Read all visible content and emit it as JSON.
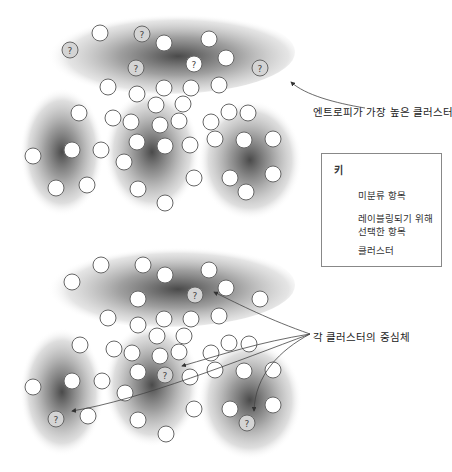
{
  "annotations": {
    "highest_entropy": "엔트로피가 가장 높은 클러스터",
    "centroids": "각 클러스터의 중심체"
  },
  "legend": {
    "title": "키",
    "items": [
      {
        "icon": "unlabeled-circle",
        "label": "미분류 항목"
      },
      {
        "icon": "question-circle",
        "label_line1": "레이블링되기 위해",
        "label_line2": "선택한 항목"
      },
      {
        "icon": "cluster-blob",
        "label": "클러스터"
      }
    ]
  },
  "question_mark": "?",
  "colors": {
    "cluster_dark": "#555555",
    "circle_fill": "#ffffff",
    "circle_stroke": "#666666",
    "selected_fill": "#d4d4d4"
  },
  "diagrams": [
    {
      "name": "entropy-sampling",
      "clusters": [
        {
          "cx": 165,
          "cy": 52,
          "rx": 130,
          "ry": 42,
          "type": "top"
        },
        {
          "cx": 62,
          "cy": 152,
          "rx": 42,
          "ry": 64
        },
        {
          "cx": 152,
          "cy": 152,
          "rx": 48,
          "ry": 62
        },
        {
          "cx": 250,
          "cy": 160,
          "rx": 52,
          "ry": 60
        }
      ],
      "items": [
        {
          "x": 100,
          "y": 33
        },
        {
          "x": 70,
          "y": 50,
          "q": true
        },
        {
          "x": 142,
          "y": 34,
          "q": true
        },
        {
          "x": 164,
          "y": 43
        },
        {
          "x": 209,
          "y": 39
        },
        {
          "x": 226,
          "y": 58
        },
        {
          "x": 136,
          "y": 68,
          "q": true
        },
        {
          "x": 194,
          "y": 64,
          "q": true,
          "white": true
        },
        {
          "x": 260,
          "y": 68,
          "q": true
        },
        {
          "x": 108,
          "y": 87
        },
        {
          "x": 137,
          "y": 94
        },
        {
          "x": 164,
          "y": 88
        },
        {
          "x": 191,
          "y": 88
        },
        {
          "x": 219,
          "y": 85
        },
        {
          "x": 156,
          "y": 105
        },
        {
          "x": 183,
          "y": 104
        },
        {
          "x": 113,
          "y": 118
        },
        {
          "x": 131,
          "y": 122
        },
        {
          "x": 160,
          "y": 125
        },
        {
          "x": 179,
          "y": 121
        },
        {
          "x": 211,
          "y": 122
        },
        {
          "x": 229,
          "y": 112
        },
        {
          "x": 248,
          "y": 113
        },
        {
          "x": 79,
          "y": 113
        },
        {
          "x": 72,
          "y": 150
        },
        {
          "x": 33,
          "y": 156
        },
        {
          "x": 101,
          "y": 150
        },
        {
          "x": 56,
          "y": 188
        },
        {
          "x": 87,
          "y": 185
        },
        {
          "x": 137,
          "y": 142
        },
        {
          "x": 165,
          "y": 146
        },
        {
          "x": 190,
          "y": 145
        },
        {
          "x": 124,
          "y": 162
        },
        {
          "x": 138,
          "y": 189
        },
        {
          "x": 194,
          "y": 178
        },
        {
          "x": 165,
          "y": 203
        },
        {
          "x": 215,
          "y": 139
        },
        {
          "x": 244,
          "y": 140
        },
        {
          "x": 273,
          "y": 139
        },
        {
          "x": 230,
          "y": 178
        },
        {
          "x": 246,
          "y": 192
        },
        {
          "x": 273,
          "y": 174
        }
      ]
    },
    {
      "name": "centroid-sampling",
      "clusters": [
        {
          "cx": 165,
          "cy": 285,
          "rx": 130,
          "ry": 42,
          "type": "top"
        },
        {
          "cx": 62,
          "cy": 392,
          "rx": 42,
          "ry": 64
        },
        {
          "cx": 152,
          "cy": 385,
          "rx": 48,
          "ry": 62
        },
        {
          "cx": 250,
          "cy": 400,
          "rx": 52,
          "ry": 60
        }
      ],
      "items": [
        {
          "x": 72,
          "y": 282
        },
        {
          "x": 101,
          "y": 265
        },
        {
          "x": 143,
          "y": 265
        },
        {
          "x": 165,
          "y": 275
        },
        {
          "x": 209,
          "y": 270
        },
        {
          "x": 226,
          "y": 288
        },
        {
          "x": 138,
          "y": 299
        },
        {
          "x": 195,
          "y": 295,
          "q": true
        },
        {
          "x": 260,
          "y": 299
        },
        {
          "x": 108,
          "y": 318
        },
        {
          "x": 138,
          "y": 325
        },
        {
          "x": 164,
          "y": 319
        },
        {
          "x": 191,
          "y": 319
        },
        {
          "x": 219,
          "y": 316
        },
        {
          "x": 157,
          "y": 336
        },
        {
          "x": 184,
          "y": 336
        },
        {
          "x": 114,
          "y": 349
        },
        {
          "x": 132,
          "y": 353
        },
        {
          "x": 160,
          "y": 356
        },
        {
          "x": 179,
          "y": 352
        },
        {
          "x": 211,
          "y": 353
        },
        {
          "x": 229,
          "y": 343
        },
        {
          "x": 249,
          "y": 344
        },
        {
          "x": 80,
          "y": 345
        },
        {
          "x": 72,
          "y": 381
        },
        {
          "x": 33,
          "y": 387
        },
        {
          "x": 102,
          "y": 381
        },
        {
          "x": 56,
          "y": 419,
          "q": true
        },
        {
          "x": 88,
          "y": 416
        },
        {
          "x": 138,
          "y": 372
        },
        {
          "x": 165,
          "y": 375,
          "q": true
        },
        {
          "x": 190,
          "y": 377
        },
        {
          "x": 125,
          "y": 393
        },
        {
          "x": 138,
          "y": 420
        },
        {
          "x": 194,
          "y": 409
        },
        {
          "x": 166,
          "y": 434
        },
        {
          "x": 215,
          "y": 370
        },
        {
          "x": 244,
          "y": 371
        },
        {
          "x": 273,
          "y": 370
        },
        {
          "x": 230,
          "y": 409
        },
        {
          "x": 247,
          "y": 423,
          "q": true
        },
        {
          "x": 273,
          "y": 405
        }
      ]
    }
  ]
}
